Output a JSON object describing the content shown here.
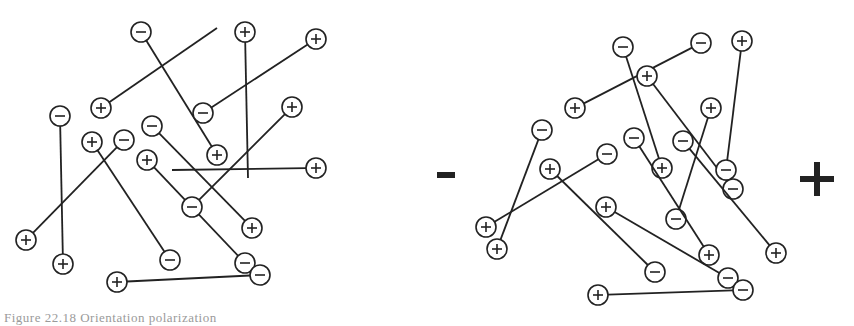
{
  "figure": {
    "caption": "Figure 22.18  Orientation polarization",
    "colors": {
      "ink": "#222222",
      "background": "#ffffff"
    },
    "charge_radius": 10,
    "panels": [
      {
        "id": "unpolarized",
        "label": "Randomly oriented dipoles (no field)",
        "dipoles": [
          {
            "neg": [
              141,
              32
            ],
            "pos": [
              217,
              155
            ]
          },
          {
            "pos": [
              101,
              108
            ],
            "end": [
              217,
              28
            ]
          },
          {
            "pos": [
              245,
              32
            ],
            "end": [
              248,
              178
            ]
          },
          {
            "neg": [
              203,
              113
            ],
            "pos": [
              316,
              39
            ]
          },
          {
            "neg": [
              60,
              116
            ],
            "pos": [
              63,
              264
            ]
          },
          {
            "pos": [
              92,
              142
            ],
            "neg": [
              170,
              260
            ]
          },
          {
            "neg": [
              124,
              140
            ],
            "pos": [
              26,
              240
            ]
          },
          {
            "neg": [
              152,
              126
            ],
            "pos": [
              252,
              228
            ]
          },
          {
            "pos": [
              147,
              160
            ],
            "neg": [
              245,
              263
            ]
          },
          {
            "neg": [
              192,
              207
            ],
            "pos": [
              292,
              107
            ]
          },
          {
            "pos": [
              117,
              282
            ],
            "neg": [
              260,
              275
            ]
          },
          {
            "end": [
              172,
              170
            ],
            "pos": [
              316,
              168
            ]
          }
        ]
      },
      {
        "id": "polarized",
        "label": "Dipoles aligned by applied field",
        "dipoles": [
          {
            "neg": [
              623,
              47
            ],
            "pos": [
              662,
              168
            ]
          },
          {
            "pos": [
              575,
              108
            ],
            "neg": [
              701,
              43
            ]
          },
          {
            "pos": [
              647,
              76
            ],
            "neg": [
              733,
              189
            ]
          },
          {
            "pos": [
              742,
              41
            ],
            "neg": [
              726,
              170
            ]
          },
          {
            "pos": [
              711,
              108
            ],
            "neg": [
              676,
              219
            ]
          },
          {
            "neg": [
              542,
              130
            ],
            "pos": [
              497,
              249
            ]
          },
          {
            "pos": [
              550,
              169
            ],
            "neg": [
              655,
              272
            ]
          },
          {
            "neg": [
              607,
              154
            ],
            "pos": [
              486,
              227
            ]
          },
          {
            "neg": [
              634,
              138
            ],
            "pos": [
              709,
              255
            ]
          },
          {
            "neg": [
              683,
              141
            ],
            "pos": [
              776,
              253
            ]
          },
          {
            "pos": [
              606,
              207
            ],
            "neg": [
              728,
              278
            ]
          },
          {
            "pos": [
              598,
              295
            ],
            "neg": [
              743,
              290
            ]
          }
        ]
      }
    ],
    "electrodes": {
      "negative": {
        "symbol": "−",
        "x": 446,
        "y": 175
      },
      "positive": {
        "symbol": "+",
        "x": 817,
        "y": 179
      }
    }
  }
}
